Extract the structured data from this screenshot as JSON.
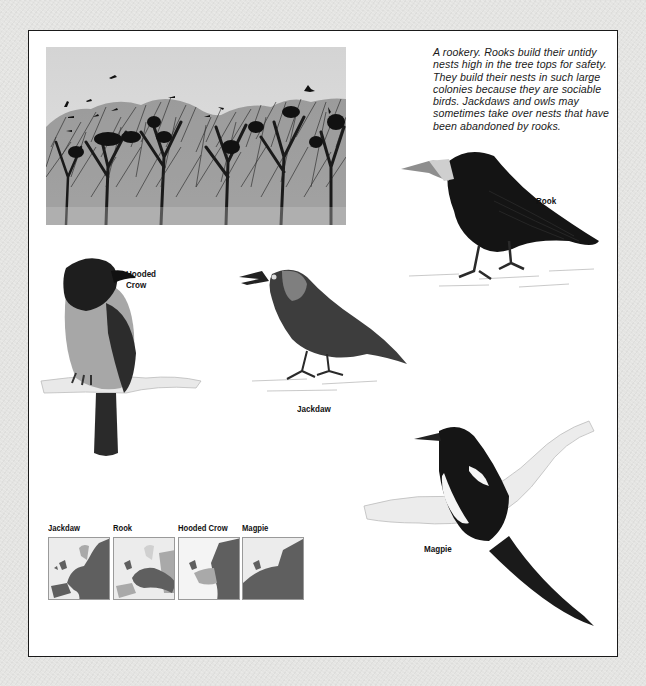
{
  "caption": "A rookery. Rooks build their untidy nests high in the tree tops for safety. They build their nests in such large colonies because they are sociable birds. Jackdaws and owls may sometimes take over nests that have been abandoned by rooks.",
  "photo": {
    "subject": "rookery silhouette of bare trees with nests and rooks"
  },
  "birds": {
    "rook": {
      "label": "Rook"
    },
    "hooded_crow": {
      "label_line1": "Hooded",
      "label_line2": "Crow"
    },
    "jackdaw": {
      "label": "Jackdaw"
    },
    "magpie": {
      "label": "Magpie"
    }
  },
  "maps": [
    {
      "label": "Jackdaw"
    },
    {
      "label": "Rook"
    },
    {
      "label": "Hooded Crow"
    },
    {
      "label": "Magpie"
    }
  ],
  "colors": {
    "range_dark": "#5f5f5f",
    "range_light": "#a9a9a9",
    "no_range": "#ececec",
    "frame": "#1a1a1a",
    "background": "#e4e4e2"
  }
}
